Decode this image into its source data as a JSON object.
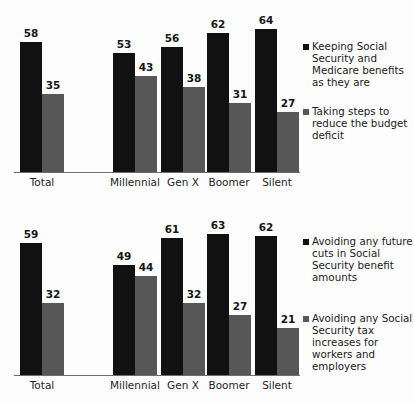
{
  "chart_data": [
    {
      "type": "bar",
      "title": "",
      "xlabel": "",
      "ylabel": "",
      "ylim": [
        0,
        70
      ],
      "grid": false,
      "legend_position": "right",
      "categories": [
        "Total",
        "Millennial",
        "Gen X",
        "Boomer",
        "Silent"
      ],
      "series": [
        {
          "name": "Keeping Social Security and Medicare benefits as they are",
          "color": "#111111",
          "values": [
            58,
            53,
            56,
            62,
            64
          ]
        },
        {
          "name": "Taking steps to reduce the budget deficit",
          "color": "#575757",
          "values": [
            35,
            43,
            38,
            31,
            27
          ]
        }
      ]
    },
    {
      "type": "bar",
      "title": "",
      "xlabel": "",
      "ylabel": "",
      "ylim": [
        0,
        70
      ],
      "grid": false,
      "legend_position": "right",
      "categories": [
        "Total",
        "Millennial",
        "Gen X",
        "Boomer",
        "Silent"
      ],
      "series": [
        {
          "name": "Avoiding any future cuts in Social Security benefit amounts",
          "color": "#111111",
          "values": [
            59,
            49,
            61,
            63,
            62
          ]
        },
        {
          "name": "Avoiding any Social Security tax increases for workers and employers",
          "color": "#575757",
          "values": [
            32,
            44,
            32,
            27,
            21
          ]
        }
      ]
    }
  ]
}
